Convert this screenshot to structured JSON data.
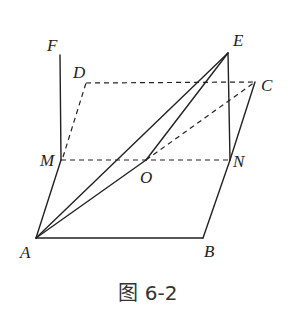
{
  "figure": {
    "caption": "图 6-2",
    "colors": {
      "line": "#222222",
      "background": "#ffffff"
    },
    "points": {
      "A": {
        "label": "A",
        "x": 36,
        "y": 238
      },
      "B": {
        "label": "B",
        "x": 203,
        "y": 238
      },
      "C": {
        "label": "C",
        "x": 255,
        "y": 82
      },
      "D": {
        "label": "D",
        "x": 86,
        "y": 83
      },
      "E": {
        "label": "E",
        "x": 228,
        "y": 53
      },
      "F": {
        "label": "F",
        "x": 60,
        "y": 55
      },
      "M": {
        "label": "M",
        "x": 61,
        "y": 160
      },
      "N": {
        "label": "N",
        "x": 230,
        "y": 160
      },
      "O": {
        "label": "O",
        "x": 146,
        "y": 160
      }
    },
    "solid_segments": [
      "AB",
      "BN",
      "NC",
      "AM",
      "MF",
      "NE",
      "AE",
      "AO",
      "OE",
      "E-top-edge"
    ],
    "dashed_segments": [
      "MN",
      "DC",
      "MD",
      "OC"
    ]
  }
}
